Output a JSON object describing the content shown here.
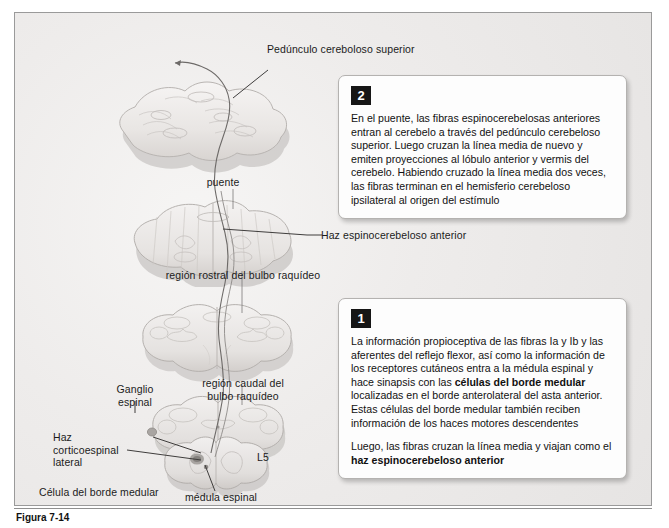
{
  "figure": {
    "title": "Haz espinocerebeloso anterior",
    "caption_number": "Figura 7-14",
    "caption_text": ""
  },
  "labels": {
    "peduncle": "Pedúnculo cereboloso superior",
    "pons": "puente",
    "rostral_medulla": "región rostral del bulbo raquídeo",
    "anterior_tract": "Haz espinocerebeloso anterior",
    "caudal_medulla": "región caudal del\nbulbo raquídeo",
    "spinal_ganglion": "Ganglio\nespinal",
    "lateral_corticospinal": "Haz\ncorticoespinal\nlateral",
    "border_cell": "Célula del borde medular",
    "spinal_cord": "médula espinal",
    "level_l5": "L5"
  },
  "callouts": [
    {
      "number": "2",
      "paragraphs": [
        {
          "runs": [
            {
              "text": "En el puente, las fibras espinocerebelosas anteriores entran al cerebelo a través del pedúnculo cerebeloso superior. Luego cruzan la línea media de nuevo y emiten proyecciones al lóbulo anterior y vermis del cerebelo. Habiendo cruzado la línea media dos veces, las fibras terminan en el hemisferio cerebeloso ipsilateral al origen del estímulo",
              "bold": false
            }
          ]
        }
      ]
    },
    {
      "number": "1",
      "paragraphs": [
        {
          "runs": [
            {
              "text": "La información propioceptiva de las fibras Ia y Ib y las aferentes del reflejo flexor, así como la información de los receptores cutáneos entra a la médula espinal y hace sinapsis con las ",
              "bold": false
            },
            {
              "text": "células del borde medular",
              "bold": true
            },
            {
              "text": " localizadas en el borde anterolateral del asta anterior. Estas células del borde medular también reciben información de los haces motores descendentes",
              "bold": false
            }
          ]
        },
        {
          "runs": [
            {
              "text": "Luego, las fibras cruzan la línea media y viajan como el ",
              "bold": false
            },
            {
              "text": "haz espinocerebeloso anterior",
              "bold": true
            }
          ]
        }
      ]
    }
  ],
  "colors": {
    "plate_background": "#eceaea",
    "plate_border": "#9a9a9a",
    "callout_background": "#fdfdfd",
    "callout_border": "#b4b2b0",
    "badge_background": "#161616",
    "badge_text": "#ffffff",
    "text": "#1b1b1b",
    "leader_line": "#4a4a4a",
    "tissue_light": "#f1efee",
    "tissue_mid": "#dedbd9",
    "tissue_dark": "#bdbab8"
  }
}
